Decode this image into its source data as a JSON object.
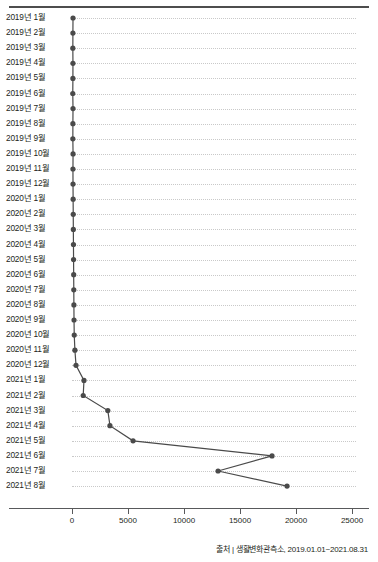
{
  "source_note": "출처 | 생활변화관측소, 2019.01.01~2021.08.31",
  "axis": {
    "x_ticks": [
      "0",
      "5000",
      "10000",
      "15000",
      "20000",
      "25000"
    ]
  },
  "colors": {
    "line": "#4a4a4a",
    "marker": "#4a4a4a",
    "grid": "#c9c9c9",
    "axis": "#58595b",
    "rule": "#4d4d4d",
    "text": "#231f20"
  },
  "chart_data": {
    "type": "line",
    "orientation": "horizontal",
    "title": "",
    "subtitle": "",
    "xlabel": "",
    "ylabel": "",
    "xlim": [
      0,
      25000
    ],
    "grid": true,
    "legend": "none",
    "categories": [
      "2019년 1월",
      "2019년 2월",
      "2019년 3월",
      "2019년 4월",
      "2019년 5월",
      "2019년 6월",
      "2019년 7월",
      "2019년 8월",
      "2019년 9월",
      "2019년 10월",
      "2019년 11월",
      "2019년 12월",
      "2020년 1월",
      "2020년 2월",
      "2020년 3월",
      "2020년 4월",
      "2020년 5월",
      "2020년 6월",
      "2020년 7월",
      "2020년 8월",
      "2020년 9월",
      "2020년 10월",
      "2020년 11월",
      "2020년 12월",
      "2021년 1월",
      "2021년 2월",
      "2021년 3월",
      "2021년 4월",
      "2021년 5월",
      "2021년 6월",
      "2021년 7월",
      "2021년 8월"
    ],
    "values": [
      90,
      80,
      75,
      85,
      80,
      70,
      90,
      80,
      75,
      95,
      85,
      90,
      100,
      110,
      120,
      130,
      140,
      150,
      160,
      170,
      180,
      200,
      260,
      360,
      1070,
      1000,
      3200,
      3390,
      5450,
      17860,
      13040,
      19200
    ],
    "tick_values": [
      0,
      5000,
      10000,
      15000,
      20000,
      25000
    ]
  }
}
